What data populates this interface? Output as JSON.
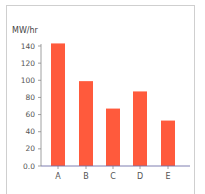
{
  "chart_data": {
    "type": "bar",
    "title": "",
    "xlabel": "",
    "ylabel": "MW/hr",
    "categories": [
      "A",
      "B",
      "C",
      "D",
      "E"
    ],
    "values": [
      143,
      99,
      67,
      87,
      53
    ],
    "ylim": [
      0,
      140
    ],
    "yticks": [
      0,
      20,
      40,
      60,
      80,
      100,
      120,
      140
    ],
    "ytick_labels": [
      "0.0",
      "20",
      "40",
      "60",
      "80",
      "100",
      "120",
      "140"
    ],
    "grid": false,
    "legend": null,
    "bar_color": "#ff5a3c",
    "axis_color": "#6f6fa8"
  }
}
